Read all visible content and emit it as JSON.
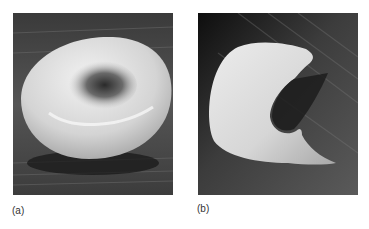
{
  "figure": {
    "panels": [
      {
        "id": "a",
        "label": "(a)",
        "subject": "normal red blood cell (biconcave disc), scanning electron micrograph"
      },
      {
        "id": "b",
        "label": "(b)",
        "subject": "sickle-shaped red blood cell, scanning electron micrograph"
      }
    ],
    "colors": {
      "background": "#ffffff",
      "micrograph_dark": "#1a1a1a",
      "micrograph_mid": "#5a5a5a",
      "cell_highlight": "#e6e6e6",
      "caption_text": "#333333"
    }
  }
}
